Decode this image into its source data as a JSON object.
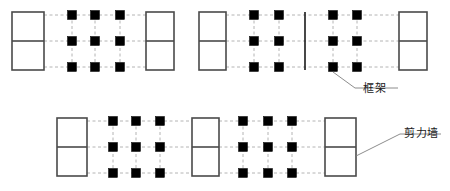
{
  "diagram": {
    "colors": {
      "wall_stroke": "#4a4a4a",
      "joint_fill": "#000000",
      "grid_line": "#b4b4b4",
      "leader_line": "#808080",
      "text": "#1a1a1a",
      "background": "#ffffff"
    },
    "annotations": [
      {
        "id": "frame-label",
        "text": "框架",
        "x": 363,
        "y": 85,
        "leader": {
          "x1": 333,
          "y1": 72,
          "x2": 355,
          "y2": 88,
          "x3": 398,
          "y3": 88
        }
      },
      {
        "id": "shear-wall-label",
        "text": "剪力墙",
        "x": 404,
        "y": 130,
        "leader": {
          "x1": 356,
          "y1": 156,
          "x2": 400,
          "y2": 134,
          "x3": 441,
          "y3": 134
        }
      }
    ],
    "groups": [
      {
        "id": "group-top-left",
        "walls": [
          {
            "id": "wall-tl-1",
            "x": 12,
            "y": 12,
            "w": 32,
            "h": 58,
            "divider_y": 41
          },
          {
            "id": "wall-tl-2",
            "x": 146,
            "y": 12,
            "w": 28,
            "h": 58,
            "divider_y": 41
          }
        ],
        "thin_walls": [],
        "grid": {
          "columns_x": [
            72,
            95,
            120
          ],
          "rows_y": [
            15,
            41,
            67
          ],
          "h_extent": [
            44,
            146
          ],
          "v_extent": [
            15,
            67
          ]
        }
      },
      {
        "id": "group-top-right",
        "walls": [
          {
            "id": "wall-tr-1",
            "x": 199,
            "y": 12,
            "w": 27,
            "h": 58,
            "divider_y": 41
          },
          {
            "id": "wall-tr-2",
            "x": 399,
            "y": 12,
            "w": 28,
            "h": 58,
            "divider_y": 41
          }
        ],
        "thin_walls": [
          {
            "id": "thin-wall-tr",
            "x": 305,
            "y1": 12,
            "y2": 70
          }
        ],
        "grid": {
          "columns_x": [
            254,
            279,
            333,
            357
          ],
          "rows_y": [
            15,
            41,
            67
          ],
          "h_extent": [
            226,
            399
          ],
          "v_extent": [
            15,
            67
          ]
        }
      },
      {
        "id": "group-bottom",
        "walls": [
          {
            "id": "wall-b-1",
            "x": 57,
            "y": 118,
            "w": 30,
            "h": 58,
            "divider_y": 147
          },
          {
            "id": "wall-b-2",
            "x": 192,
            "y": 118,
            "w": 27,
            "h": 58,
            "divider_y": 147
          },
          {
            "id": "wall-b-3",
            "x": 325,
            "y": 118,
            "w": 31,
            "h": 58,
            "divider_y": 147
          }
        ],
        "thin_walls": [],
        "grid": {
          "columns_x": [
            113,
            136,
            160,
            243,
            268,
            292
          ],
          "rows_y": [
            121,
            147,
            173
          ],
          "h_extent": [
            87,
            325
          ],
          "v_extent": [
            121,
            173
          ]
        }
      }
    ],
    "joint_size": 9,
    "legend": {
      "frame_label": "框架",
      "shear_wall_label": "剪力墙"
    }
  }
}
